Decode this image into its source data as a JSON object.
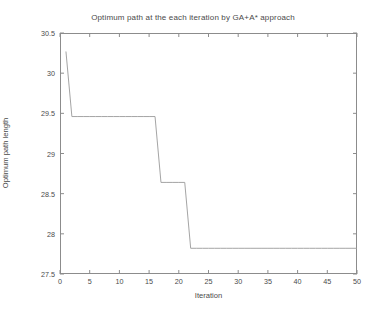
{
  "chart_data": {
    "type": "line",
    "title": "Optimum path at the each iteration by GA+A* approach",
    "xlabel": "Iteration",
    "ylabel": "Optimum path length",
    "xlim": [
      0,
      50
    ],
    "ylim": [
      27.5,
      30.5
    ],
    "xticks": [
      0,
      5,
      10,
      15,
      20,
      25,
      30,
      35,
      40,
      45,
      50
    ],
    "xtick_labels": [
      "0",
      "5",
      "10",
      "15",
      "20",
      "25",
      "30",
      "35",
      "40",
      "45",
      "50"
    ],
    "yticks": [
      27.5,
      28,
      28.5,
      29,
      29.5,
      30,
      30.5
    ],
    "ytick_labels": [
      "27.5",
      "28",
      "28.5",
      "29",
      "29.5",
      "30",
      "30.5"
    ],
    "grid": false,
    "legend": null,
    "line_color": "#9a9a9a",
    "series": [
      {
        "name": "Optimum path length",
        "x": [
          1,
          2,
          3,
          4,
          5,
          6,
          7,
          8,
          9,
          10,
          11,
          12,
          13,
          14,
          15,
          16,
          17,
          18,
          19,
          20,
          21,
          22,
          23,
          24,
          25,
          26,
          27,
          28,
          29,
          30,
          31,
          32,
          33,
          34,
          35,
          36,
          37,
          38,
          39,
          40,
          41,
          42,
          43,
          44,
          45,
          46,
          47,
          48,
          49,
          50
        ],
        "values": [
          30.27,
          29.46,
          29.46,
          29.46,
          29.46,
          29.46,
          29.46,
          29.46,
          29.46,
          29.46,
          29.46,
          29.46,
          29.46,
          29.46,
          29.46,
          29.46,
          28.64,
          28.64,
          28.64,
          28.64,
          28.64,
          27.82,
          27.82,
          27.82,
          27.82,
          27.82,
          27.82,
          27.82,
          27.82,
          27.82,
          27.82,
          27.82,
          27.82,
          27.82,
          27.82,
          27.82,
          27.82,
          27.82,
          27.82,
          27.82,
          27.82,
          27.82,
          27.82,
          27.82,
          27.82,
          27.82,
          27.82,
          27.82,
          27.82,
          27.82
        ]
      }
    ]
  }
}
